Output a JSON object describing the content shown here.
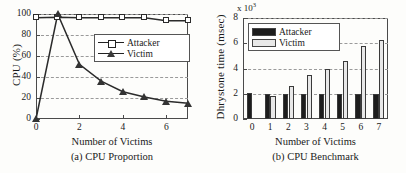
{
  "figure": {
    "panels": [
      "a",
      "b"
    ]
  },
  "panel_a": {
    "caption": "(a) CPU Proportion",
    "xlabel": "Number of Victims",
    "ylabel": "CPU (%)",
    "yticks": [
      "0",
      "20",
      "40",
      "60",
      "80",
      "100"
    ],
    "xticks": [
      "0",
      "2",
      "4",
      "6"
    ],
    "legend": [
      {
        "label": "Attacker",
        "marker": "square-marker"
      },
      {
        "label": "Victim",
        "marker": "triangle-marker"
      }
    ]
  },
  "panel_b": {
    "caption": "(b) CPU Benchmark",
    "xlabel": "Number of Victims",
    "ylabel": "Dhrystone time (msec)",
    "multiplier_prefix": "x 10",
    "multiplier_exponent": "3",
    "yticks": [
      "0",
      "2",
      "4",
      "6",
      "8"
    ],
    "xticks": [
      "0",
      "1",
      "2",
      "3",
      "4",
      "5",
      "6",
      "7"
    ],
    "legend": [
      {
        "label": "Attacker",
        "swatch": "black-swatch"
      },
      {
        "label": "Victim",
        "swatch": "light-gray-swatch"
      }
    ]
  },
  "colors": {
    "attacker_bar": "#1d1d1d",
    "victim_bar": "#e8e8e8",
    "line": "#2b2b2b",
    "grid": "#9a9a9a",
    "axis": "#4a4a4a",
    "background": "#fdfdfb"
  },
  "chart_data": [
    {
      "type": "line",
      "title": "(a) CPU Proportion",
      "xlabel": "Number of Victims",
      "ylabel": "CPU (%)",
      "x": [
        0,
        1,
        2,
        3,
        4,
        5,
        6,
        7
      ],
      "xlim": [
        0,
        7
      ],
      "ylim": [
        0,
        100
      ],
      "xticks": [
        0,
        2,
        4,
        6
      ],
      "yticks": [
        0,
        20,
        40,
        60,
        80,
        100
      ],
      "grid": true,
      "legend_position": "center-right-inside",
      "series": [
        {
          "name": "Attacker",
          "marker": "square",
          "values": [
            96.5,
            97,
            96.5,
            96.5,
            96.5,
            96.5,
            93.5,
            93.5
          ]
        },
        {
          "name": "Victim",
          "marker": "triangle",
          "values": [
            0,
            100,
            52,
            36,
            26,
            21,
            17,
            15
          ]
        }
      ]
    },
    {
      "type": "bar",
      "title": "(b) CPU Benchmark",
      "xlabel": "Number of Victims",
      "ylabel": "Dhrystone time (msec)",
      "y_multiplier": "x 10^3",
      "categories": [
        "0",
        "1",
        "2",
        "3",
        "4",
        "5",
        "6",
        "7"
      ],
      "xticks": [
        0,
        1,
        2,
        3,
        4,
        5,
        6,
        7
      ],
      "yticks": [
        0,
        2,
        4,
        6,
        8
      ],
      "ylim": [
        0,
        8
      ],
      "grid": true,
      "legend_position": "upper-left-inside",
      "series": [
        {
          "name": "Attacker",
          "color": "#1d1d1d",
          "values": [
            2.02,
            1.95,
            1.95,
            1.95,
            1.95,
            1.95,
            1.95,
            1.95
          ]
        },
        {
          "name": "Victim",
          "color": "#e8e8e8",
          "values": [
            0,
            1.8,
            2.6,
            3.5,
            3.95,
            4.6,
            5.8,
            6.25
          ]
        }
      ]
    }
  ]
}
